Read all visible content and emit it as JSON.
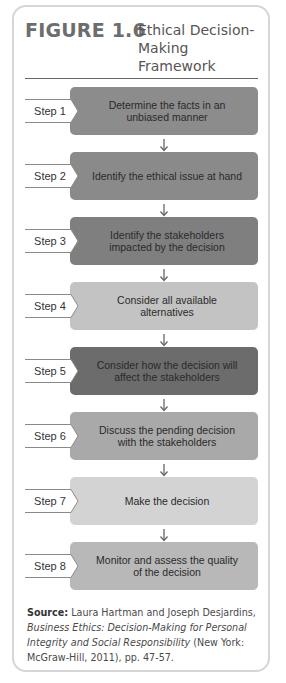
{
  "figure": {
    "number": "FIGURE 1.6",
    "title": "Ethical Decision-Making Framework"
  },
  "steps": [
    {
      "label": "Step 1",
      "text": "Determine the facts in an unbiased manner",
      "color": "#8c8c8c"
    },
    {
      "label": "Step 2",
      "text": "Identify the ethical issue at hand",
      "color": "#8a8a8a"
    },
    {
      "label": "Step 3",
      "text": "Identify the stakeholders impacted by the decision",
      "color": "#7f7f7f"
    },
    {
      "label": "Step 4",
      "text": "Consider all available alternatives",
      "color": "#c3c3c3"
    },
    {
      "label": "Step 5",
      "text": "Consider how the decision will affect the stakeholders",
      "color": "#6c6c6c"
    },
    {
      "label": "Step 6",
      "text": "Discuss the pending decision with the stakeholders",
      "color": "#a9a9a9"
    },
    {
      "label": "Step 7",
      "text": "Make the decision",
      "color": "#d3d3d3"
    },
    {
      "label": "Step 8",
      "text": "Monitor and assess the quality of the decision",
      "color": "#b8b8b8"
    }
  ],
  "source": {
    "label": "Source:",
    "authors": "Laura Hartman and Joseph Desjardins,",
    "book": "Business Ethics: Decision-Making for Personal Integrity and Social Responsibility",
    "publisher": "(New York: McGraw-Hill, 2011), pp. 47-57."
  }
}
